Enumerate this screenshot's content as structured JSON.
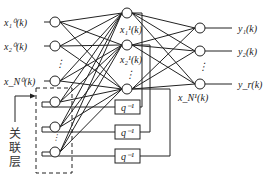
{
  "diagram": {
    "title": "",
    "input_labels": [
      "x₁⁰(k)",
      "x₂⁰(k)",
      "x_N⁰(k)"
    ],
    "hidden_labels": [
      "x₁¹(k)",
      "x₂¹(k)",
      "x_N¹(k)"
    ],
    "output_labels": [
      "y₁(k)",
      "y₂(k)",
      "y_r(k)"
    ],
    "delay_label": "q⁻¹",
    "context_layer_label": [
      "关",
      "联",
      "层"
    ],
    "ellipsis": "⋮"
  }
}
